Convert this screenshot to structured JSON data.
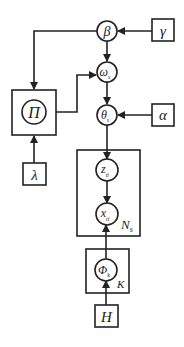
{
  "diagram": {
    "type": "plate-notation graphical model",
    "nodes": {
      "beta": {
        "label": "β",
        "shape": "circle"
      },
      "gamma": {
        "label": "γ",
        "shape": "box"
      },
      "omega": {
        "label": "ω",
        "sub": "s",
        "shape": "circle"
      },
      "pi": {
        "label": "Π",
        "shape": "circle-in-box"
      },
      "lambda": {
        "label": "λ",
        "shape": "box"
      },
      "theta": {
        "label": "θ",
        "sub": "s",
        "shape": "circle"
      },
      "alpha": {
        "label": "α",
        "shape": "box"
      },
      "z": {
        "label": "z",
        "sub": "ti",
        "shape": "circle"
      },
      "x": {
        "label": "x",
        "sub": "ti",
        "shape": "circle"
      },
      "phi": {
        "label": "Φ",
        "sub": "k",
        "shape": "circle"
      },
      "h": {
        "label": "H",
        "shape": "box"
      }
    },
    "plates": {
      "n": {
        "label": "N",
        "sub": "s"
      },
      "k": {
        "label": "K"
      }
    },
    "edges": [
      [
        "gamma",
        "beta"
      ],
      [
        "beta",
        "omega"
      ],
      [
        "beta",
        "pi"
      ],
      [
        "pi",
        "omega"
      ],
      [
        "lambda",
        "pi"
      ],
      [
        "omega",
        "theta"
      ],
      [
        "alpha",
        "theta"
      ],
      [
        "theta",
        "z"
      ],
      [
        "z",
        "x"
      ],
      [
        "phi",
        "x"
      ],
      [
        "h",
        "phi"
      ]
    ]
  }
}
